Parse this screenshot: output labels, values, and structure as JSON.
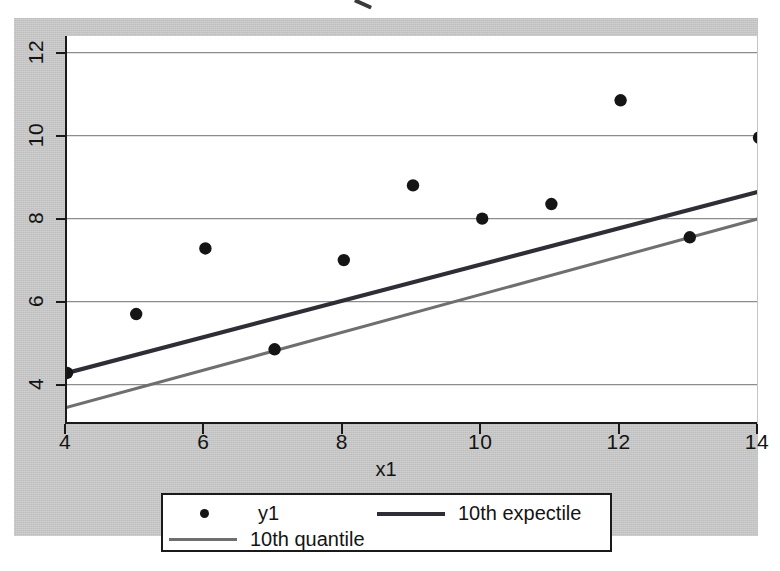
{
  "figure": {
    "background_color": "#c9c9c9",
    "panel_color": "#ffffff",
    "top_artifact": "cut-off-mark"
  },
  "chart_data": {
    "type": "scatter",
    "title": "",
    "xlabel": "x1",
    "ylabel": "",
    "xlim": [
      4,
      14
    ],
    "ylim": [
      3.05,
      12.4
    ],
    "xticks": [
      4,
      6,
      8,
      10,
      12,
      14
    ],
    "yticks": [
      4,
      6,
      8,
      10,
      12
    ],
    "xtick_labels": [
      "4",
      "6",
      "8",
      "10",
      "12",
      "14"
    ],
    "ytick_labels": [
      "4",
      "6",
      "8",
      "10",
      "12"
    ],
    "grid": "horizontal",
    "grid_color": "#8c8c8c",
    "legend_position": "below-plot",
    "series": [
      {
        "name": "y1",
        "type": "scatter",
        "color": "#151515",
        "x": [
          4,
          5,
          6,
          7,
          8,
          9,
          10,
          11,
          12,
          13,
          14
        ],
        "values": [
          4.28,
          5.7,
          7.28,
          4.85,
          7.0,
          8.8,
          8.0,
          8.35,
          10.85,
          7.55,
          9.95
        ]
      },
      {
        "name": "10th expectile",
        "type": "line",
        "color": "#2e2e36",
        "x": [
          4,
          14
        ],
        "values": [
          4.28,
          8.65
        ]
      },
      {
        "name": "10th quantile",
        "type": "line",
        "color": "#6f6f6f",
        "x": [
          4,
          14
        ],
        "values": [
          3.45,
          8.0
        ]
      }
    ],
    "legend": [
      {
        "label": "y1",
        "marker": "dot",
        "color": "#151515"
      },
      {
        "label": "10th expectile",
        "marker": "line-thick",
        "color": "#2e2e36"
      },
      {
        "label": "10th quantile",
        "marker": "line-thin",
        "color": "#6f6f6f"
      }
    ]
  }
}
